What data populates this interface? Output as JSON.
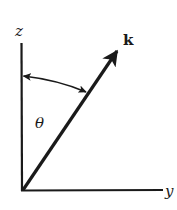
{
  "diagram": {
    "type": "coordinate-axes-with-vector",
    "colors": {
      "ink": "#1a1a1a",
      "background": "#ffffff"
    },
    "axes": {
      "vertical": {
        "label": "z"
      },
      "horizontal": {
        "label": "y"
      }
    },
    "vector": {
      "label": "k"
    },
    "angle": {
      "label": "θ",
      "between": [
        "z",
        "k"
      ]
    }
  }
}
